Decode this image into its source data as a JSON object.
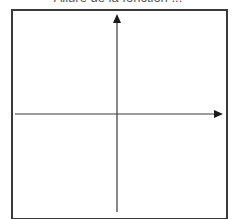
{
  "caption": {
    "text": "Allure de la fonction ...",
    "note": "partially cropped at top edge"
  },
  "diagram": {
    "type": "coordinate-axes",
    "frame_color": "#3a3a3a",
    "axis_color": "#3a3a3a",
    "x_axis": {
      "direction": "right",
      "has_arrow": true,
      "label": ""
    },
    "y_axis": {
      "direction": "up",
      "has_arrow": true,
      "label": ""
    },
    "curve": "none (empty graph area)"
  }
}
